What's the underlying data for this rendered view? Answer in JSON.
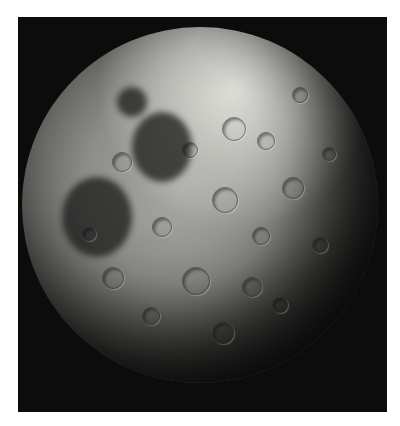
{
  "image": {
    "subject": "Moon (far side), black-and-white photograph",
    "background_color": "#ffffff",
    "frame_color": "#0c0c0c"
  },
  "features": {
    "maria": [
      {
        "name": "dark-mare-left",
        "x": 40,
        "y": 150,
        "w": 70,
        "h": 80
      },
      {
        "name": "dark-mare-center",
        "x": 110,
        "y": 85,
        "w": 60,
        "h": 70
      },
      {
        "name": "dark-mare-small",
        "x": 95,
        "y": 60,
        "w": 30,
        "h": 30
      }
    ],
    "craters": [
      {
        "x": 200,
        "y": 90,
        "s": 22
      },
      {
        "x": 235,
        "y": 105,
        "s": 16
      },
      {
        "x": 160,
        "y": 115,
        "s": 14
      },
      {
        "x": 90,
        "y": 125,
        "s": 18
      },
      {
        "x": 260,
        "y": 150,
        "s": 20
      },
      {
        "x": 190,
        "y": 160,
        "s": 24
      },
      {
        "x": 130,
        "y": 190,
        "s": 18
      },
      {
        "x": 230,
        "y": 200,
        "s": 16
      },
      {
        "x": 290,
        "y": 210,
        "s": 14
      },
      {
        "x": 80,
        "y": 240,
        "s": 20
      },
      {
        "x": 160,
        "y": 240,
        "s": 26
      },
      {
        "x": 220,
        "y": 250,
        "s": 18
      },
      {
        "x": 120,
        "y": 280,
        "s": 16
      },
      {
        "x": 190,
        "y": 295,
        "s": 20
      },
      {
        "x": 250,
        "y": 270,
        "s": 14
      },
      {
        "x": 300,
        "y": 120,
        "s": 12
      },
      {
        "x": 60,
        "y": 200,
        "s": 12
      },
      {
        "x": 270,
        "y": 60,
        "s": 14
      }
    ]
  }
}
